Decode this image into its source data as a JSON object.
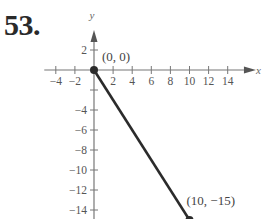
{
  "problem_number": "53.",
  "chart_data": {
    "type": "line",
    "title": "",
    "xlabel": "x",
    "ylabel": "y",
    "xlim": [
      -5,
      16
    ],
    "ylim": [
      -15.5,
      4
    ],
    "grid": false,
    "x_ticks": [
      -4,
      -2,
      2,
      4,
      6,
      8,
      10,
      12,
      14
    ],
    "x_tick_labels": [
      "−4",
      "−2",
      "2",
      "4",
      "6",
      "8",
      "10",
      "12",
      "14"
    ],
    "y_ticks": [
      2,
      -2,
      -4,
      -6,
      -8,
      -10,
      -12,
      -14
    ],
    "y_tick_labels": [
      "2",
      "",
      "−4",
      "−6",
      "−8",
      "−10",
      "−12",
      "−14"
    ],
    "series": [
      {
        "name": "segment",
        "x": [
          0,
          10
        ],
        "y": [
          0,
          -15
        ],
        "color": "#2b2b2b",
        "endpoints": "filled"
      }
    ],
    "annotations": [
      {
        "text": "(0, 0)",
        "x": 0,
        "y": 0
      },
      {
        "text": "(10, −15)",
        "x": 10,
        "y": -15
      }
    ]
  }
}
